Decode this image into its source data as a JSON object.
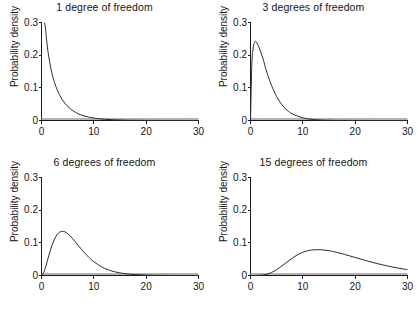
{
  "figure": {
    "background": "#ffffff",
    "axis_color": "#1a1a1a",
    "curve_color": "#2b2b2b",
    "baseline_color": "#9a9a9a",
    "panel_count": 4
  },
  "chart_data": [
    {
      "type": "line",
      "title": "1 degree of freedom",
      "xlabel": "",
      "ylabel": "Probability density",
      "xlim": [
        0,
        30
      ],
      "ylim": [
        0,
        0.3
      ],
      "xticks": [
        0,
        10,
        20,
        30
      ],
      "yticks": [
        0,
        0.1,
        0.2,
        0.3
      ],
      "xtick_labels": [
        "0",
        "10",
        "20",
        "30"
      ],
      "ytick_labels": [
        "0",
        "0.1",
        "0.2",
        "0.3"
      ],
      "grid": false,
      "legend": "none",
      "distribution": "chi-square",
      "df": 1,
      "peak": {
        "x": 1.0,
        "y": 0.242
      },
      "x": [
        0.6,
        0.8,
        1.0,
        1.2,
        1.5,
        2.0,
        2.5,
        3.0,
        3.5,
        4.0,
        5.0,
        6.0,
        7.0,
        8.0,
        9.0,
        10.0,
        12.0,
        14.0,
        16.0,
        18.0,
        20.0,
        24.0,
        30.0
      ],
      "y": [
        0.3057,
        0.2756,
        0.242,
        0.2159,
        0.185,
        0.144,
        0.1157,
        0.094,
        0.0768,
        0.063,
        0.0431,
        0.0298,
        0.0208,
        0.0147,
        0.0104,
        0.0074,
        0.0038,
        0.002,
        0.001,
        0.0006,
        0.0003,
        0.0001,
        0.0
      ]
    },
    {
      "type": "line",
      "title": "3 degrees of freedom",
      "xlabel": "",
      "ylabel": "Probability density",
      "xlim": [
        0,
        30
      ],
      "ylim": [
        0,
        0.3
      ],
      "xticks": [
        0,
        10,
        20,
        30
      ],
      "yticks": [
        0,
        0.1,
        0.2,
        0.3
      ],
      "xtick_labels": [
        "0",
        "10",
        "20",
        "30"
      ],
      "ytick_labels": [
        "0",
        "0.1",
        "0.2",
        "0.3"
      ],
      "grid": false,
      "legend": "none",
      "distribution": "chi-square",
      "df": 3,
      "peak": {
        "x": 1.0,
        "y": 0.242
      },
      "x": [
        0.0,
        0.25,
        0.5,
        0.75,
        1.0,
        1.5,
        2.0,
        2.5,
        3.0,
        4.0,
        5.0,
        6.0,
        7.0,
        8.0,
        10.0,
        12.0,
        14.0,
        16.0,
        18.0,
        20.0,
        24.0,
        30.0
      ],
      "y": [
        0.0,
        0.1704,
        0.2197,
        0.2389,
        0.242,
        0.2291,
        0.2076,
        0.1832,
        0.1542,
        0.108,
        0.0731,
        0.0483,
        0.0314,
        0.0202,
        0.0081,
        0.0031,
        0.0012,
        0.0004,
        0.0002,
        0.0001,
        0.0,
        0.0
      ]
    },
    {
      "type": "line",
      "title": "6 degrees of freedom",
      "xlabel": "",
      "ylabel": "Probability density",
      "xlim": [
        0,
        30
      ],
      "ylim": [
        0,
        0.3
      ],
      "xticks": [
        0,
        10,
        20,
        30
      ],
      "yticks": [
        0,
        0.1,
        0.2,
        0.3
      ],
      "xtick_labels": [
        "0",
        "10",
        "20",
        "30"
      ],
      "ytick_labels": [
        "0",
        "0.1",
        "0.2",
        "0.3"
      ],
      "grid": false,
      "legend": "none",
      "distribution": "chi-square",
      "df": 6,
      "peak": {
        "x": 4.0,
        "y": 0.1353
      },
      "x": [
        0.0,
        0.5,
        1.0,
        2.0,
        3.0,
        4.0,
        5.0,
        6.0,
        7.0,
        8.0,
        9.0,
        10.0,
        12.0,
        14.0,
        16.0,
        18.0,
        20.0,
        22.0,
        25.0,
        30.0
      ],
      "y": [
        0.0,
        0.0122,
        0.038,
        0.092,
        0.1255,
        0.1353,
        0.1282,
        0.112,
        0.0925,
        0.0733,
        0.0563,
        0.0421,
        0.0223,
        0.0113,
        0.0055,
        0.0026,
        0.0012,
        0.0005,
        0.0002,
        0.0
      ]
    },
    {
      "type": "line",
      "title": "15 degrees of freedom",
      "xlabel": "",
      "ylabel": "Probability density",
      "xlim": [
        0,
        30
      ],
      "ylim": [
        0,
        0.3
      ],
      "xticks": [
        0,
        10,
        20,
        30
      ],
      "yticks": [
        0,
        0.1,
        0.2,
        0.3
      ],
      "xtick_labels": [
        "0",
        "10",
        "20",
        "30"
      ],
      "ytick_labels": [
        "0",
        "0.1",
        "0.2",
        "0.3"
      ],
      "grid": false,
      "legend": "none",
      "distribution": "chi-square",
      "df": 15,
      "peak": {
        "x": 13.0,
        "y": 0.0792
      },
      "x": [
        0.0,
        2.0,
        3.0,
        4.0,
        5.0,
        6.0,
        7.0,
        8.0,
        9.0,
        10.0,
        11.0,
        12.0,
        13.0,
        14.0,
        15.0,
        16.0,
        18.0,
        20.0,
        22.0,
        24.0,
        26.0,
        28.0,
        30.0
      ],
      "y": [
        0.0,
        0.0008,
        0.0034,
        0.009,
        0.018,
        0.0293,
        0.0416,
        0.0534,
        0.0635,
        0.0711,
        0.0761,
        0.0786,
        0.0792,
        0.0781,
        0.0759,
        0.0727,
        0.0645,
        0.0552,
        0.0459,
        0.0373,
        0.0297,
        0.0232,
        0.0179
      ]
    }
  ]
}
